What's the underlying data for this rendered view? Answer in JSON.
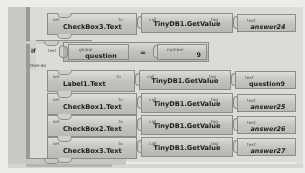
{
  "app": {
    "name": "MIT App Inventor Blocks Editor",
    "view": "blocks-canvas"
  },
  "labels": {
    "set": "set",
    "to": "to",
    "call": "call",
    "tag": "tag",
    "text": "text",
    "global": "global",
    "number": "number",
    "if": "if",
    "test": "test",
    "then_do": "then-do",
    "equals": "="
  },
  "blocks": {
    "row1": {
      "property": "CheckBox3.Text",
      "method": "TinyDB1.GetValue",
      "tag_value": "answer24"
    },
    "condition": {
      "variable": "question",
      "operator": "=",
      "number": "9"
    },
    "row2": {
      "property": "Label1.Text",
      "method": "TinyDB1.GetValue",
      "tag_value": "question9"
    },
    "row3": {
      "property": "CheckBox1.Text",
      "method": "TinyDB1.GetValue",
      "tag_value": "answer25"
    },
    "row4": {
      "property": "CheckBox2.Text",
      "method": "TinyDB1.GetValue",
      "tag_value": "answer26"
    },
    "row5": {
      "property": "CheckBox3.Text",
      "method": "TinyDB1.GetValue",
      "tag_value": "answer27"
    }
  },
  "colors": {
    "block_face": "#c4c4c1",
    "block_border": "#8b8b87",
    "canvas": "#ececeb",
    "gutter": "#c9c9c6"
  }
}
